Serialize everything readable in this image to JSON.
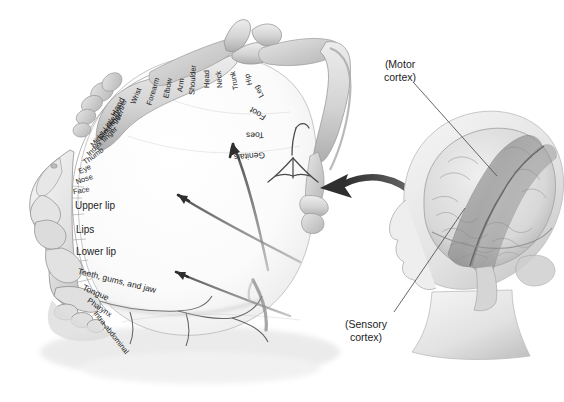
{
  "figure": {
    "palette": {
      "ink": "#1c1c1c",
      "tissue_light": "#f2f2f2",
      "tissue_mid": "#cfcfcf",
      "tissue_dark": "#9a9a9a",
      "tissue_shadow": "#7d7d7d",
      "arrow_dark": "#3a3a3a",
      "arrow_mid": "#6b6b6b",
      "leader_line": "#555555",
      "background": "#ffffff"
    }
  },
  "homunculus": {
    "strip_labels": [
      {
        "text": "Hand",
        "size": "md",
        "x": 113,
        "y": 116,
        "rot": -62
      },
      {
        "text": "Wrist",
        "size": "sm",
        "x": 133,
        "y": 104,
        "rot": -68
      },
      {
        "text": "Forearm",
        "size": "sm",
        "x": 149,
        "y": 105,
        "rot": -73
      },
      {
        "text": "Elbow",
        "size": "sm",
        "x": 166,
        "y": 98,
        "rot": -79
      },
      {
        "text": "Arm",
        "size": "sm",
        "x": 180,
        "y": 92,
        "rot": -83
      },
      {
        "text": "Shoulder",
        "size": "sm",
        "x": 192,
        "y": 95,
        "rot": -87
      },
      {
        "text": "Head",
        "size": "sm",
        "x": 207,
        "y": 88,
        "rot": -91
      },
      {
        "text": "Neck",
        "size": "sm",
        "x": 220,
        "y": 88,
        "rot": -95
      },
      {
        "text": "Trunk",
        "size": "sm",
        "x": 236,
        "y": 90,
        "rot": -100
      },
      {
        "text": "Hip",
        "size": "sm",
        "x": 250,
        "y": 85,
        "rot": -106
      },
      {
        "text": "Leg",
        "size": "sm",
        "x": 262,
        "y": 97,
        "rot": -118
      },
      {
        "text": "Foot",
        "size": "md",
        "x": 265,
        "y": 118,
        "rot": -148
      },
      {
        "text": "Toes",
        "size": "md",
        "x": 264,
        "y": 135,
        "rot": 179
      },
      {
        "text": "Genitals",
        "size": "md",
        "x": 265,
        "y": 155,
        "rot": 176
      },
      {
        "text": "Little finger",
        "size": "sm",
        "x": 105,
        "y": 130,
        "rot": -56
      },
      {
        "text": "Ring finger",
        "size": "sm",
        "x": 100,
        "y": 139,
        "rot": -52
      },
      {
        "text": "Middle finger",
        "size": "sm",
        "x": 92,
        "y": 146,
        "rot": -48
      },
      {
        "text": "Index finger",
        "size": "sm",
        "x": 88,
        "y": 155,
        "rot": -44
      },
      {
        "text": "Thumb",
        "size": "sm",
        "x": 84,
        "y": 163,
        "rot": -36
      },
      {
        "text": "Eye",
        "size": "sm",
        "x": 79,
        "y": 172,
        "rot": -26
      },
      {
        "text": "Nose",
        "size": "sm",
        "x": 76,
        "y": 182,
        "rot": -18
      },
      {
        "text": "Face",
        "size": "sm",
        "x": 73,
        "y": 192,
        "rot": -10
      },
      {
        "text": "Upper lip",
        "size": "lg",
        "x": 75,
        "y": 206,
        "rot": 0
      },
      {
        "text": "Lips",
        "size": "lg",
        "x": 76,
        "y": 230,
        "rot": 0
      },
      {
        "text": "Lower lip",
        "size": "lg",
        "x": 76,
        "y": 252,
        "rot": 0
      },
      {
        "text": "Teeth, gums, and jaw",
        "size": "md",
        "x": 78,
        "y": 271,
        "rot": 14
      },
      {
        "text": "Tongue",
        "size": "md",
        "x": 83,
        "y": 287,
        "rot": 24
      },
      {
        "text": "Pharynx",
        "size": "sm",
        "x": 88,
        "y": 300,
        "rot": 34
      },
      {
        "text": "Intra-abdominal",
        "size": "sm",
        "x": 95,
        "y": 312,
        "rot": 52
      }
    ]
  },
  "callouts": [
    {
      "name": "motor-cortex",
      "line1": "(Motor",
      "line2": "cortex)",
      "x": 384,
      "y": 58
    },
    {
      "name": "sensory-cortex",
      "line1": "(Sensory",
      "line2": "cortex)",
      "x": 345,
      "y": 318
    }
  ]
}
